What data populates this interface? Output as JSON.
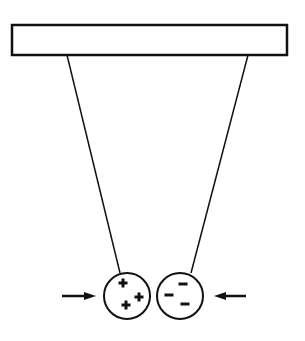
{
  "diagram": {
    "support_bar": {
      "x": 12,
      "y": 25,
      "width": 275,
      "height": 30
    },
    "strings": [
      {
        "x1": 67,
        "y1": 55,
        "x2": 120,
        "y2": 273
      },
      {
        "x1": 248,
        "y1": 55,
        "x2": 191,
        "y2": 273
      }
    ],
    "balls": [
      {
        "name": "positive-ball",
        "cx": 127,
        "cy": 296,
        "r": 23,
        "charge": "+",
        "signs": [
          {
            "x": 123,
            "y": 283
          },
          {
            "x": 139,
            "y": 297
          },
          {
            "x": 126,
            "y": 305
          }
        ]
      },
      {
        "name": "negative-ball",
        "cx": 180,
        "cy": 296,
        "r": 23,
        "charge": "-",
        "signs": [
          {
            "x": 183,
            "y": 284
          },
          {
            "x": 169,
            "y": 295
          },
          {
            "x": 185,
            "y": 304
          }
        ]
      }
    ],
    "arrows": [
      {
        "name": "left-arrow",
        "x1": 62,
        "x2": 96,
        "y": 296,
        "direction": "right"
      },
      {
        "name": "right-arrow",
        "x1": 246,
        "x2": 214,
        "y": 296,
        "direction": "left"
      }
    ],
    "stroke_color": "#111111"
  }
}
